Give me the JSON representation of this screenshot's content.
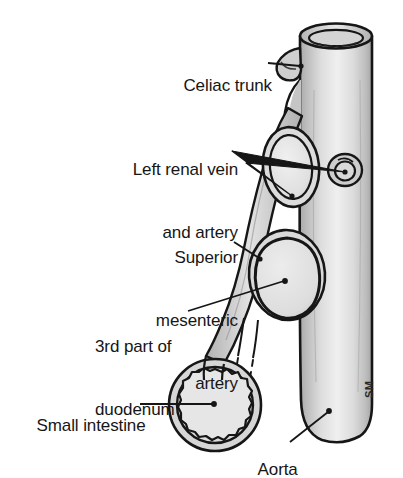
{
  "figure": {
    "type": "medical-line-illustration",
    "background_color": "#ffffff",
    "ink_color": "#161616",
    "vessel_fill_color": "#c9c9c9",
    "vessel_highlight_color": "#efefef",
    "lumen_fill_color": "#e3e3e3"
  },
  "labels": {
    "celiac_trunk": "Celiac trunk",
    "left_renal_line1": "Left renal vein",
    "left_renal_line2": "and artery",
    "superior_mesenteric_line1": "Superior",
    "superior_mesenteric_line2": "mesenteric",
    "superior_mesenteric_line3": "artery",
    "duodenum_line1": "3rd part of",
    "duodenum_line2": "duodenum",
    "small_intestine": "Small intestine",
    "aorta": "Aorta"
  },
  "signature": {
    "artist_initials": "SM"
  },
  "structures": [
    {
      "name": "aorta",
      "description": "large vertical cylinder, cut open at top, rounded at bottom"
    },
    {
      "name": "celiac-trunk",
      "description": "short stump branching from left side near top of aorta"
    },
    {
      "name": "superior-mesenteric-artery",
      "description": "vessel branching from aorta descending anterior and to the left"
    },
    {
      "name": "left-renal-vein",
      "description": "large oval cross-section overlying the superior mesenteric artery"
    },
    {
      "name": "left-renal-artery",
      "description": "small ring ostium on right side of aorta"
    },
    {
      "name": "third-part-of-duodenum",
      "description": "thick-walled oval ring crossed by the superior mesenteric artery"
    },
    {
      "name": "small-intestine",
      "description": "circular loop with crinkled mucosal inner lining at lower left"
    },
    {
      "name": "mesenteric-vessels",
      "description": "two thin parallel lines fading into dashes below the duodenum"
    }
  ]
}
